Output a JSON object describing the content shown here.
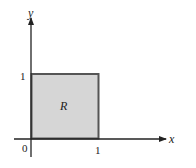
{
  "diagram": {
    "axes": {
      "x_label": "x",
      "y_label": "y",
      "origin_label": "0",
      "x_tick_label": "1",
      "y_tick_label": "1"
    },
    "region": {
      "label": "R",
      "fill": "#d4d4d4",
      "stroke": "#555555",
      "x_range": [
        0,
        1
      ],
      "y_range": [
        0,
        1
      ]
    }
  }
}
